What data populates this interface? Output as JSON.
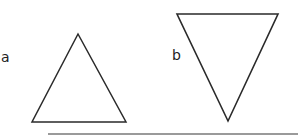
{
  "labels": {
    "a": "a",
    "b": "b"
  },
  "colors": {
    "stroke": "#2a2a2a",
    "rule": "#9a9a9a"
  },
  "shapes": {
    "triangle_a": {
      "orientation": "upward",
      "points": [
        [
          78,
          34
        ],
        [
          32,
          122
        ],
        [
          126,
          122
        ]
      ]
    },
    "triangle_b": {
      "orientation": "downward",
      "points": [
        [
          177,
          14
        ],
        [
          278,
          14
        ],
        [
          228,
          121
        ]
      ]
    }
  }
}
